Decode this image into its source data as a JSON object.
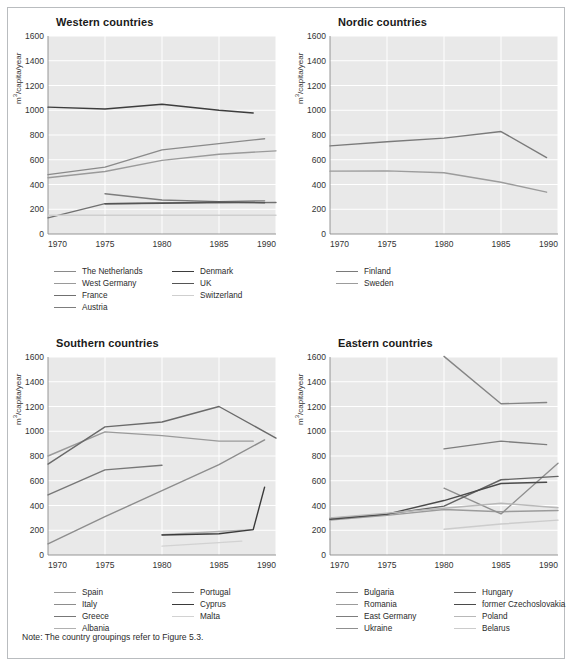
{
  "figure": {
    "note": "Note: The country groupings refer to Figure 5.3.",
    "ylabel_prefix": "m",
    "ylabel_sup": "3",
    "ylabel_suffix": "/capita/year",
    "yticks": [
      "1600",
      "1400",
      "1200",
      "1000",
      "800",
      "600",
      "400",
      "200",
      "0"
    ],
    "xticks": [
      "1970",
      "1975",
      "1980",
      "1985",
      "1990"
    ],
    "plot_bg": "#e9e9e9",
    "grid_color": "#ffffff"
  },
  "chart_data": [
    {
      "type": "line",
      "title": "Western countries",
      "xlabel": "",
      "ylabel": "m3/capita/year",
      "xlim": [
        1970,
        1990
      ],
      "ylim": [
        0,
        1600
      ],
      "xticks": [
        1970,
        1975,
        1980,
        1985,
        1990
      ],
      "yticks": [
        0,
        200,
        400,
        600,
        800,
        1000,
        1200,
        1400,
        1600
      ],
      "grid": true,
      "legend_position": "bottom",
      "series": [
        {
          "name": "The Netherlands",
          "color": "#8a8a8a",
          "x": [
            1970,
            1975,
            1980,
            1985,
            1989
          ],
          "y": [
            480,
            540,
            680,
            730,
            770
          ]
        },
        {
          "name": "West Germany",
          "color": "#9a9a9a",
          "x": [
            1970,
            1975,
            1980,
            1985,
            1990
          ],
          "y": [
            455,
            505,
            595,
            645,
            672
          ]
        },
        {
          "name": "France",
          "color": "#707070",
          "x": [
            1970,
            1975,
            1980,
            1985,
            1990
          ],
          "y": [
            130,
            245,
            250,
            252,
            255
          ]
        },
        {
          "name": "Austria",
          "color": "#7d7d7d",
          "x": [
            1975,
            1980,
            1985,
            1989
          ],
          "y": [
            325,
            275,
            262,
            268
          ]
        },
        {
          "name": "Denmark",
          "color": "#3d3d3d",
          "x": [
            1970,
            1975,
            1980,
            1985,
            1988
          ],
          "y": [
            1025,
            1010,
            1048,
            1000,
            978
          ]
        },
        {
          "name": "UK",
          "color": "#555555",
          "x": [
            1975,
            1980,
            1985,
            1989
          ],
          "y": [
            245,
            248,
            258,
            252
          ]
        },
        {
          "name": "Switzerland",
          "color": "#cfcfcf",
          "x": [
            1970,
            1990
          ],
          "y": [
            152,
            152
          ]
        }
      ]
    },
    {
      "type": "line",
      "title": "Nordic countries",
      "xlabel": "",
      "ylabel": "m3/capita/year",
      "xlim": [
        1970,
        1990
      ],
      "ylim": [
        0,
        1600
      ],
      "xticks": [
        1970,
        1975,
        1980,
        1985,
        1990
      ],
      "yticks": [
        0,
        200,
        400,
        600,
        800,
        1000,
        1200,
        1400,
        1600
      ],
      "grid": true,
      "legend_position": "bottom",
      "series": [
        {
          "name": "Finland",
          "color": "#7a7a7a",
          "x": [
            1970,
            1975,
            1980,
            1985,
            1989
          ],
          "y": [
            712,
            745,
            775,
            828,
            618
          ]
        },
        {
          "name": "Sweden",
          "color": "#9c9c9c",
          "x": [
            1970,
            1975,
            1980,
            1985,
            1989
          ],
          "y": [
            508,
            510,
            495,
            418,
            338
          ]
        }
      ]
    },
    {
      "type": "line",
      "title": "Southern countries",
      "xlabel": "",
      "ylabel": "m3/capita/year",
      "xlim": [
        1970,
        1990
      ],
      "ylim": [
        0,
        1600
      ],
      "xticks": [
        1970,
        1975,
        1980,
        1985,
        1990
      ],
      "yticks": [
        0,
        200,
        400,
        600,
        800,
        1000,
        1200,
        1400,
        1600
      ],
      "grid": true,
      "legend_position": "bottom",
      "series": [
        {
          "name": "Spain",
          "color": "#9a9a9a",
          "x": [
            1970,
            1975,
            1980,
            1985,
            1988
          ],
          "y": [
            800,
            995,
            965,
            920,
            920
          ]
        },
        {
          "name": "Italy",
          "color": "#8d8d8d",
          "x": [
            1970,
            1975,
            1980,
            1985,
            1989
          ],
          "y": [
            90,
            310,
            520,
            730,
            930
          ]
        },
        {
          "name": "Greece",
          "color": "#777777",
          "x": [
            1970,
            1975,
            1980
          ],
          "y": [
            485,
            688,
            725
          ]
        },
        {
          "name": "Albania",
          "color": "#b0b0b0",
          "x": [
            1980,
            1985,
            1988
          ],
          "y": [
            165,
            190,
            205
          ]
        },
        {
          "name": "Portugal",
          "color": "#6a6a6a",
          "x": [
            1970,
            1975,
            1980,
            1985,
            1990
          ],
          "y": [
            735,
            1035,
            1075,
            1200,
            945
          ]
        },
        {
          "name": "Cyprus",
          "color": "#3a3a3a",
          "x": [
            1980,
            1985,
            1988,
            1989
          ],
          "y": [
            162,
            172,
            205,
            548
          ]
        },
        {
          "name": "Malta",
          "color": "#d2d2d2",
          "x": [
            1980,
            1985,
            1987
          ],
          "y": [
            72,
            100,
            112
          ]
        }
      ]
    },
    {
      "type": "line",
      "title": "Eastern countries",
      "xlabel": "",
      "ylabel": "m3/capita/year",
      "xlim": [
        1970,
        1990
      ],
      "ylim": [
        0,
        1600
      ],
      "xticks": [
        1970,
        1975,
        1980,
        1985,
        1990
      ],
      "yticks": [
        0,
        200,
        400,
        600,
        800,
        1000,
        1200,
        1400,
        1600
      ],
      "grid": true,
      "legend_position": "bottom",
      "series": [
        {
          "name": "Bulgaria",
          "color": "#858585",
          "x": [
            1980,
            1985,
            1989
          ],
          "y": [
            1605,
            1222,
            1232
          ]
        },
        {
          "name": "Romania",
          "color": "#9b9b9b",
          "x": [
            1970,
            1975,
            1980,
            1985,
            1990
          ],
          "y": [
            282,
            320,
            368,
            350,
            360
          ]
        },
        {
          "name": "East Germany",
          "color": "#7d7d7d",
          "x": [
            1980,
            1985,
            1989
          ],
          "y": [
            858,
            920,
            892
          ]
        },
        {
          "name": "Ukraine",
          "color": "#8f8f8f",
          "x": [
            1980,
            1985,
            1990
          ],
          "y": [
            540,
            332,
            742
          ]
        },
        {
          "name": "Hungary",
          "color": "#636363",
          "x": [
            1970,
            1975,
            1980,
            1985,
            1990
          ],
          "y": [
            295,
            330,
            395,
            608,
            635
          ]
        },
        {
          "name": "former Czechoslovakia",
          "color": "#4a4a4a",
          "x": [
            1970,
            1975,
            1980,
            1985,
            1989
          ],
          "y": [
            288,
            330,
            440,
            578,
            588
          ]
        },
        {
          "name": "Poland",
          "color": "#b8b8b8",
          "x": [
            1970,
            1975,
            1980,
            1985,
            1990
          ],
          "y": [
            300,
            338,
            378,
            418,
            382
          ]
        },
        {
          "name": "Belarus",
          "color": "#cccccc",
          "x": [
            1980,
            1985,
            1990
          ],
          "y": [
            208,
            250,
            282
          ]
        }
      ]
    }
  ]
}
